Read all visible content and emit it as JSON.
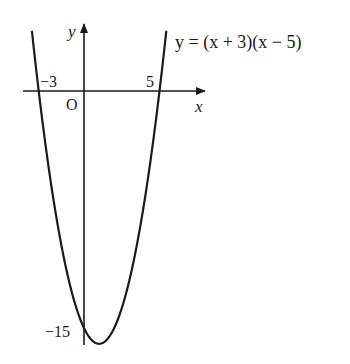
{
  "chart_data": {
    "type": "line",
    "title": "",
    "function": "y = (x + 3)(x - 5)",
    "equation_label": "y = (x + 3)(x − 5)",
    "xlabel": "x",
    "ylabel": "y",
    "origin_label": "O",
    "x_intercepts": [
      -3,
      5
    ],
    "y_intercept": -15,
    "vertex": {
      "x": 1,
      "y": -16
    },
    "tick_labels": {
      "x_left": "−3",
      "x_right": "5",
      "y_intercept": "−15"
    },
    "xlim": [
      -3.5,
      8
    ],
    "ylim": [
      -16.5,
      4.5
    ],
    "grid": false,
    "legend": "none",
    "series": [
      {
        "name": "y = (x + 3)(x − 5)",
        "x": [
          -3.4,
          -3,
          -2,
          -1,
          0,
          1,
          2,
          3,
          4,
          5,
          5.4
        ],
        "values": [
          3.36,
          0,
          -7,
          -12,
          -15,
          -16,
          -15,
          -12,
          -7,
          0,
          3.36
        ]
      }
    ]
  },
  "colors": {
    "curve": "#1a1a1a",
    "axes": "#1a1a1a",
    "background": "#ffffff"
  }
}
